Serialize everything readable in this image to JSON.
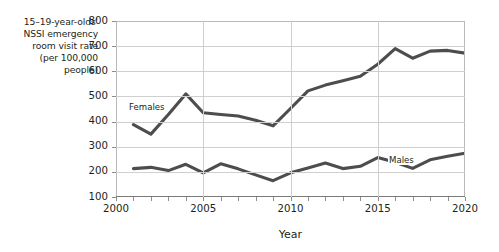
{
  "chart_data": {
    "type": "line",
    "title": "",
    "ylabel": "15–19-year-olds' NSSI emergency room visit rate (per 100,000 people)",
    "ylabel_lines": [
      "15–19-year-olds'",
      "NSSI emergency",
      "room visit rate",
      "(per 100,000",
      "people)"
    ],
    "xlabel": "Year",
    "xlim": [
      2000,
      2020
    ],
    "ylim": [
      100,
      800
    ],
    "ytick_labels": [
      "100",
      "200",
      "300",
      "400",
      "500",
      "600",
      "700",
      "800"
    ],
    "yticks": [
      100,
      200,
      300,
      400,
      500,
      600,
      700,
      800
    ],
    "xtick_labels": [
      "2000",
      "2005",
      "2010",
      "2015",
      "2020"
    ],
    "xticks": [
      2000,
      2005,
      2010,
      2015,
      2020
    ],
    "xticks_minor": [
      2001,
      2002,
      2003,
      2004,
      2006,
      2007,
      2008,
      2009,
      2011,
      2012,
      2013,
      2014,
      2016,
      2017,
      2018,
      2019
    ],
    "grid": true,
    "legend_position": "inline-labels",
    "x": [
      2001,
      2002,
      2003,
      2004,
      2005,
      2006,
      2007,
      2008,
      2009,
      2010,
      2011,
      2012,
      2013,
      2014,
      2015,
      2016,
      2017,
      2018,
      2019,
      2020
    ],
    "series": [
      {
        "name": "Females",
        "color": "#4d4d4d",
        "values": [
          388,
          350,
          428,
          510,
          435,
          428,
          422,
          405,
          383,
          452,
          522,
          545,
          562,
          580,
          628,
          690,
          652,
          680,
          683,
          672
        ]
      },
      {
        "name": "Males",
        "color": "#4d4d4d",
        "values": [
          213,
          218,
          205,
          230,
          196,
          232,
          212,
          188,
          165,
          196,
          215,
          235,
          213,
          222,
          257,
          238,
          214,
          248,
          262,
          274
        ]
      }
    ]
  },
  "axes": {
    "x_title": "Year"
  }
}
